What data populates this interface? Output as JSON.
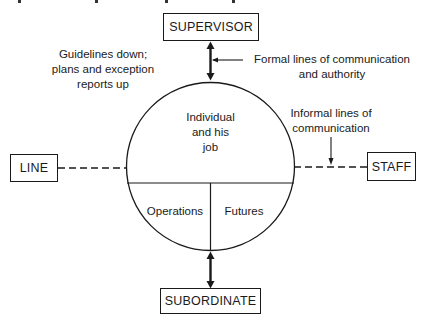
{
  "diagram": {
    "nodes": {
      "supervisor": "SUPERVISOR",
      "subordinate": "SUBORDINATE",
      "line": "LINE",
      "staff": "STAFF"
    },
    "circle": {
      "top_line1": "Individual",
      "top_line2": "and his",
      "top_line3": "job",
      "bottom_left": "Operations",
      "bottom_right": "Futures"
    },
    "annotations": {
      "guidelines_line1": "Guidelines down;",
      "guidelines_line2": "plans and exception",
      "guidelines_line3": "reports up",
      "formal_line1": "Formal lines of communication",
      "formal_line2": "and authority",
      "informal_line1": "Informal lines of",
      "informal_line2": "communication"
    },
    "colors": {
      "ink": "#1a1a1a",
      "background": "#ffffff"
    }
  }
}
